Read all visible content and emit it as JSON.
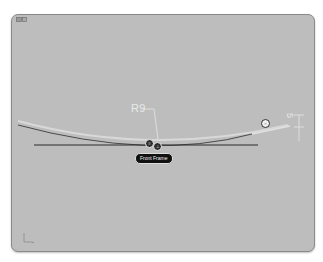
{
  "viewport": {
    "background_color": "#bdbdbd",
    "corner_icon": "view-cube-icon"
  },
  "sketch": {
    "arc": {
      "stroke_color": "#4a4a4a",
      "highlight_color": "#dcdcdc"
    },
    "frame_line": {
      "stroke_color": "#2a2a2a"
    },
    "dimensions": {
      "radius_label": "R9",
      "height_label": "5"
    },
    "frame_label": "Front Frame",
    "constraint_badges": [
      {
        "symbol": "≡",
        "style": "dark"
      },
      {
        "symbol": "⊥",
        "style": "dark"
      },
      {
        "symbol": "○",
        "style": "light"
      }
    ]
  },
  "axis_triad": {
    "icon": "axis-triad-icon"
  }
}
